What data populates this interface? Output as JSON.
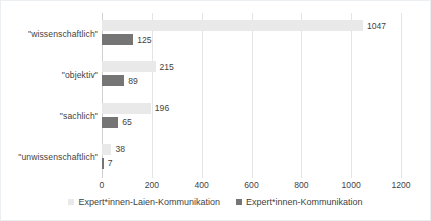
{
  "chart_data": {
    "type": "bar",
    "orientation": "horizontal",
    "title": "",
    "xlabel": "",
    "ylabel": "",
    "xlim": [
      0,
      1200
    ],
    "xticks": [
      0,
      200,
      400,
      600,
      800,
      1000,
      1200
    ],
    "xtick_labels": [
      "0",
      "200",
      "400",
      "600",
      "800",
      "1000",
      "1200"
    ],
    "grid": true,
    "grid_axis": "x",
    "legend_position": "bottom",
    "categories": [
      "\"wissenschaftlich\"",
      "\"objektiv\"",
      "\"sachlich\"",
      "\"unwissenschaftlich\""
    ],
    "series": [
      {
        "name": "Expert*innen-Laien-Kommunikation",
        "color": "#e9e9e9",
        "values": [
          1047,
          215,
          196,
          38
        ],
        "value_labels": [
          "1047",
          "215",
          "196",
          "38"
        ]
      },
      {
        "name": "Expert*innen-Kommunikation",
        "color": "#757575",
        "values": [
          125,
          89,
          65,
          7
        ],
        "value_labels": [
          "125",
          "89",
          "65",
          "7"
        ]
      }
    ]
  },
  "legend": {
    "items": [
      {
        "label": "Expert*innen-Laien-Kommunikation",
        "swatch": "series-a-fill"
      },
      {
        "label": "Expert*innen-Kommunikation",
        "swatch": "series-b-fill"
      }
    ]
  },
  "colors": {
    "series_a": "#e9e9e9",
    "series_b": "#757575",
    "gridline": "#e4e4e4",
    "text": "#3f3f3f",
    "frame_border": "#eceff1",
    "background": "#ffffff"
  }
}
